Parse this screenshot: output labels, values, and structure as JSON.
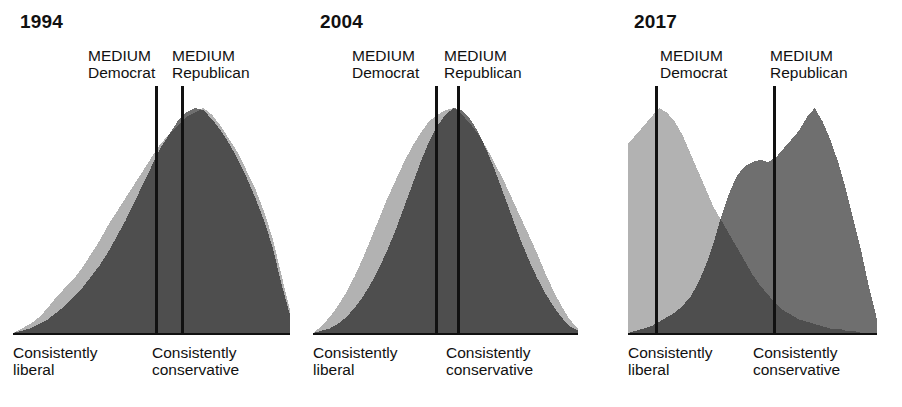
{
  "figure": {
    "title_visible": false,
    "colors": {
      "democrat_fill": "#b2b2b2",
      "republican_fill": "#6f6f6f",
      "overlap_fill": "#2b2b2b",
      "median_line": "#111111",
      "baseline": "#111111",
      "background": "#ffffff"
    }
  },
  "panels": [
    {
      "year": "1994",
      "median_democrat": {
        "line1": "MEDIUM",
        "line2": "Democrat"
      },
      "median_republican": {
        "line1": "MEDIUM",
        "line2": "Republican"
      },
      "axis_left": {
        "line1": "Consistently",
        "line2": "liberal"
      },
      "axis_right": {
        "line1": "Consistently",
        "line2": "conservative"
      }
    },
    {
      "year": "2004",
      "median_democrat": {
        "line1": "MEDIUM",
        "line2": "Democrat"
      },
      "median_republican": {
        "line1": "MEDIUM",
        "line2": "Republican"
      },
      "axis_left": {
        "line1": "Consistently",
        "line2": "liberal"
      },
      "axis_right": {
        "line1": "Consistently",
        "line2": "conservative"
      }
    },
    {
      "year": "2017",
      "median_democrat": {
        "line1": "MEDIUM",
        "line2": "Democrat"
      },
      "median_republican": {
        "line1": "MEDIUM",
        "line2": "Republican"
      },
      "axis_left": {
        "line1": "Consistently",
        "line2": "liberal"
      },
      "axis_right": {
        "line1": "Consistently",
        "line2": "conservative"
      }
    }
  ],
  "chart_data": {
    "type": "area",
    "xlabel": "Consistently liberal  →  Consistently conservative",
    "ylabel": "Share of respondents",
    "grid": false,
    "legend_position": "none",
    "x": [
      0,
      1,
      2,
      3,
      4,
      5,
      6,
      7,
      8,
      9,
      10,
      11,
      12,
      13,
      14,
      15,
      16,
      17,
      18,
      19,
      20,
      21,
      22,
      23,
      24,
      25,
      26,
      27,
      28,
      29,
      30,
      31,
      32
    ],
    "panels": [
      {
        "year": "1994",
        "median_democrat_x": 14.5,
        "median_republican_x": 17.0,
        "series": [
          {
            "name": "Democrat",
            "color": "#b2b2b2",
            "values": [
              0,
              2,
              4,
              7,
              11,
              16,
              20,
              24,
              29,
              35,
              41,
              48,
              54,
              60,
              66,
              72,
              78,
              84,
              88,
              92,
              96,
              98,
              100,
              97,
              92,
              86,
              80,
              72,
              64,
              54,
              42,
              26,
              10
            ]
          },
          {
            "name": "Republican",
            "color": "#6f6f6f",
            "values": [
              0,
              1,
              2,
              4,
              6,
              9,
              12,
              16,
              20,
              25,
              30,
              36,
              43,
              50,
              58,
              66,
              74,
              82,
              88,
              94,
              98,
              100,
              99,
              95,
              90,
              84,
              77,
              69,
              60,
              50,
              38,
              22,
              8
            ]
          }
        ]
      },
      {
        "year": "2004",
        "median_democrat_x": 15.0,
        "median_republican_x": 17.2,
        "series": [
          {
            "name": "Democrat",
            "color": "#b2b2b2",
            "values": [
              0,
              3,
              7,
              12,
              18,
              25,
              33,
              42,
              51,
              60,
              68,
              76,
              83,
              89,
              94,
              97,
              99,
              100,
              97,
              93,
              88,
              82,
              75,
              68,
              60,
              52,
              44,
              36,
              27,
              19,
              12,
              6,
              2
            ]
          },
          {
            "name": "Republican",
            "color": "#6f6f6f",
            "values": [
              0,
              1,
              2,
              4,
              7,
              11,
              16,
              22,
              29,
              37,
              46,
              56,
              66,
              76,
              85,
              92,
              97,
              100,
              99,
              95,
              89,
              81,
              72,
              62,
              52,
              42,
              33,
              25,
              18,
              12,
              7,
              3,
              1
            ]
          }
        ]
      },
      {
        "year": "2017",
        "median_democrat_x": 5.5,
        "median_republican_x": 21.5,
        "series": [
          {
            "name": "Democrat",
            "color": "#b2b2b2",
            "values": [
              84,
              88,
              92,
              96,
              100,
              98,
              94,
              88,
              80,
              72,
              64,
              56,
              50,
              44,
              38,
              32,
              26,
              21,
              17,
              13,
              10,
              8,
              6,
              5,
              4,
              3,
              2,
              2,
              1,
              1,
              0,
              0,
              0
            ]
          },
          {
            "name": "Republican",
            "color": "#6f6f6f",
            "values": [
              0,
              1,
              2,
              3,
              5,
              7,
              9,
              12,
              16,
              22,
              30,
              40,
              52,
              62,
              70,
              74,
              76,
              77,
              76,
              78,
              82,
              86,
              90,
              96,
              100,
              94,
              86,
              76,
              64,
              50,
              36,
              20,
              6
            ]
          }
        ]
      }
    ]
  }
}
